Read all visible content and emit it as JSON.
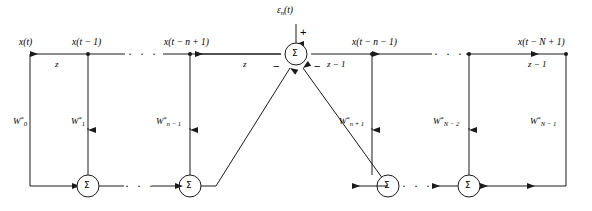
{
  "figure": {
    "type": "signal-flow-diagram",
    "stroke_color": "#1a1a1a",
    "background_color": "#ffffff"
  },
  "top_line": {
    "error_input": {
      "label_base": "ε",
      "label_sub": "n",
      "label_arg": "(t)",
      "full": "ε_n(t)",
      "sign": "+"
    },
    "summer_symbol": "Σ",
    "minus_sign": "−"
  },
  "taps": [
    {
      "id": "tap-0",
      "label": "x(t)"
    },
    {
      "id": "tap-1",
      "label": "x(t − 1)"
    },
    {
      "id": "tap-n-1",
      "label": "x(t − n + 1)"
    },
    {
      "id": "tap-n-minus-1-right",
      "label": "x(t − n − 1)"
    },
    {
      "id": "tap-N-1",
      "label": "x(t − N + 1)"
    }
  ],
  "delays": [
    {
      "id": "delay-left-1",
      "label": "z"
    },
    {
      "id": "delay-left-2",
      "label": "z"
    },
    {
      "id": "delay-right-1",
      "label": "z − 1"
    },
    {
      "id": "delay-right-2",
      "label": "z − 1"
    }
  ],
  "weights": [
    {
      "id": "w-0",
      "base": "W",
      "sup": "*",
      "sub": "0"
    },
    {
      "id": "w-1",
      "base": "W",
      "sup": "*",
      "sub": "1"
    },
    {
      "id": "w-n-1",
      "base": "W",
      "sup": "*",
      "sub": "n − 1"
    },
    {
      "id": "w-n+1",
      "base": "W",
      "sup": "*",
      "sub": "n + 1"
    },
    {
      "id": "w-N-2",
      "base": "W",
      "sup": "*",
      "sub": "N − 2"
    },
    {
      "id": "w-N-1",
      "base": "W",
      "sup": "*",
      "sub": "N − 1"
    }
  ],
  "bottom_summers": [
    {
      "id": "sum-left-1",
      "symbol": "Σ"
    },
    {
      "id": "sum-left-2",
      "symbol": "Σ"
    },
    {
      "id": "sum-right-1",
      "symbol": "Σ"
    },
    {
      "id": "sum-right-2",
      "symbol": "Σ"
    }
  ],
  "ellipses": [
    {
      "id": "ellipsis-top-left",
      "label": "· · ·"
    },
    {
      "id": "ellipsis-top-right",
      "label": "· · ·"
    },
    {
      "id": "ellipsis-bottom-left",
      "label": "· · ·"
    },
    {
      "id": "ellipsis-bottom-right",
      "label": "· · ·"
    }
  ]
}
